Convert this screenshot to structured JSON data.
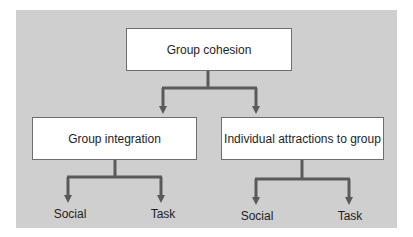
{
  "diagram": {
    "type": "hierarchy",
    "root": {
      "label": "Group cohesion"
    },
    "children": [
      {
        "label": "Group integration",
        "leaves": [
          "Social",
          "Task"
        ]
      },
      {
        "label": "Individual attractions to group",
        "leaves": [
          "Social",
          "Task"
        ]
      }
    ]
  },
  "colors": {
    "panel_background": "#cfcfcf",
    "node_fill": "#ffffff",
    "node_border": "#6e6e6e",
    "connector": "#5a5a5a",
    "text": "#1e1e1e"
  }
}
